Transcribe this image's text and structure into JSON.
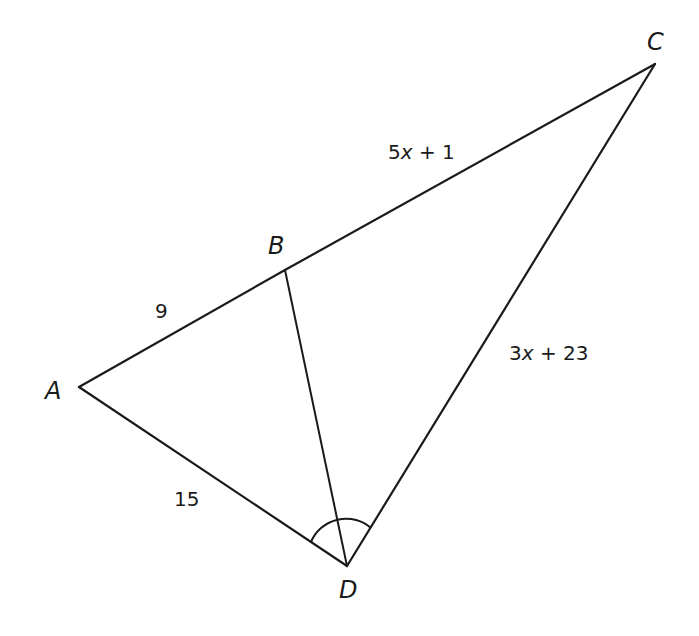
{
  "diagram": {
    "type": "triangle-angle-bisector",
    "points": {
      "A": {
        "label": "A",
        "x": 79,
        "y": 387
      },
      "B": {
        "label": "B",
        "x": 285,
        "y": 270
      },
      "C": {
        "label": "C",
        "x": 655,
        "y": 64
      },
      "D": {
        "label": "D",
        "x": 347,
        "y": 566
      }
    },
    "segments": [
      {
        "name": "AB",
        "from": "A",
        "to": "B"
      },
      {
        "name": "BC",
        "from": "B",
        "to": "C"
      },
      {
        "name": "AD",
        "from": "A",
        "to": "D"
      },
      {
        "name": "CD",
        "from": "C",
        "to": "D"
      },
      {
        "name": "BD",
        "from": "B",
        "to": "D"
      }
    ],
    "measures": {
      "AB": {
        "text": "9"
      },
      "BC": {
        "prefix": "5",
        "var": "x",
        "suffix": " + 1"
      },
      "AD": {
        "text": "15"
      },
      "CD": {
        "prefix": "3",
        "var": "x",
        "suffix": " + 23"
      }
    },
    "angle_mark": {
      "vertex": "D",
      "description": "single arc spanning angle ADC, bisected by BD"
    },
    "colors": {
      "stroke": "#1a1a1a",
      "background": "#ffffff"
    }
  }
}
